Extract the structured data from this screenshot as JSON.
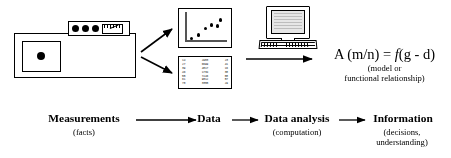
{
  "diagram": {
    "colors": {
      "ink": "#000000",
      "screen": "#e6e6e6",
      "axis": "#555555"
    }
  },
  "apparatus": {
    "name": "measuring-instrument",
    "panel_indicator_count": 3,
    "gauge_label": ""
  },
  "scatter": {
    "type": "scatter",
    "points": [
      {
        "x": 0.1,
        "y": 0.12
      },
      {
        "x": 0.26,
        "y": 0.25
      },
      {
        "x": 0.44,
        "y": 0.5
      },
      {
        "x": 0.58,
        "y": 0.62
      },
      {
        "x": 0.72,
        "y": 0.58
      },
      {
        "x": 0.8,
        "y": 0.8
      }
    ]
  },
  "data_table": {
    "rows": [
      [
        "14",
        "2983",
        "23"
      ],
      [
        "27",
        "6699",
        "41"
      ],
      [
        "39",
        "4817",
        "16"
      ],
      [
        "46",
        "1734",
        "38"
      ],
      [
        "55",
        "7246",
        "08"
      ],
      [
        "61",
        "9012",
        "57"
      ],
      [
        "78",
        "3355",
        "29"
      ]
    ]
  },
  "computer": {
    "name": "desktop-computer"
  },
  "equation": {
    "text": "A (m/n) = f(g - d)",
    "lead": "A (m/n) = ",
    "fn": "f",
    "tail": "(g - d)",
    "caption_line1": "(model or",
    "caption_line2": "functional relationship)"
  },
  "flow": {
    "steps": [
      {
        "label": "Measurements",
        "sub": [
          "(facts)"
        ]
      },
      {
        "label": "Data",
        "sub": []
      },
      {
        "label": "Data analysis",
        "sub": [
          "(computation)"
        ]
      },
      {
        "label": "Information",
        "sub": [
          "(decisions,",
          "understanding)"
        ]
      }
    ]
  }
}
